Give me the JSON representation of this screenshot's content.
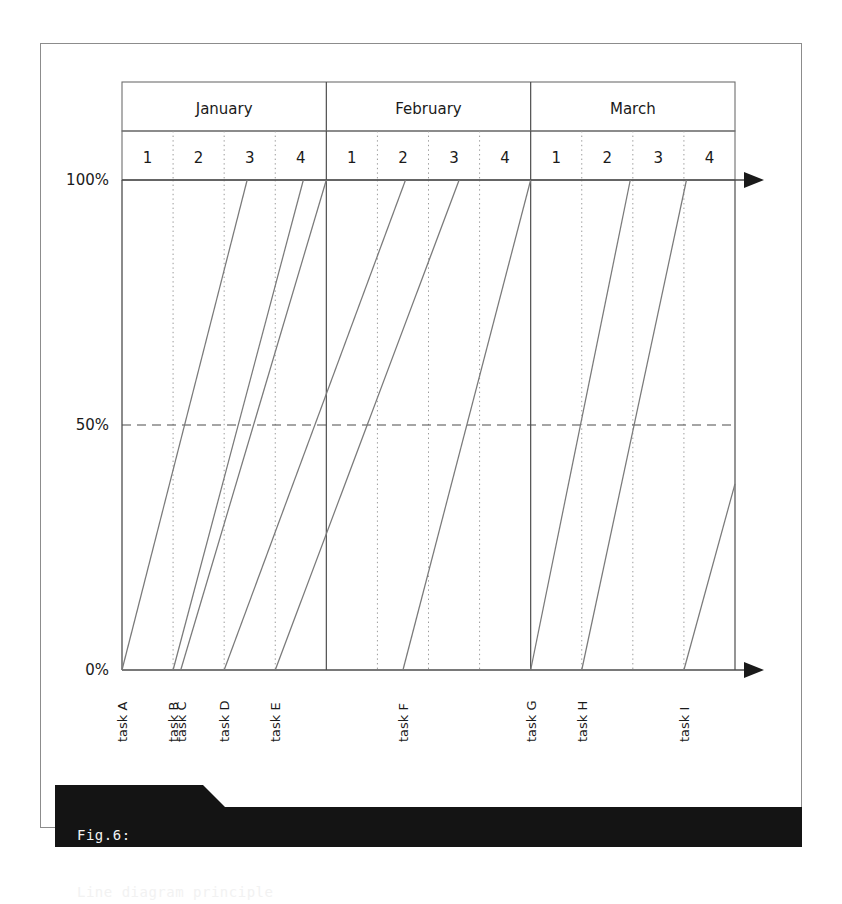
{
  "figure": {
    "caption_number": "Fig.6:",
    "caption_title": "Line diagram principle"
  },
  "chart_data": {
    "type": "line",
    "title": "Line diagram principle",
    "xlabel": "",
    "ylabel": "",
    "ylim": [
      0,
      100
    ],
    "ytick_labels": [
      "0%",
      "50%",
      "100%"
    ],
    "ytick_values": [
      0,
      50,
      100
    ],
    "grid": "dotted weekly gridlines, solid month separators, dashed 50% line",
    "legend": "none",
    "x_axis_type": "calendar weeks grouped by month",
    "months": [
      {
        "name": "January",
        "weeks": [
          "1",
          "2",
          "3",
          "4"
        ]
      },
      {
        "name": "February",
        "weeks": [
          "1",
          "2",
          "3",
          "4"
        ]
      },
      {
        "name": "March",
        "weeks": [
          "1",
          "2",
          "3",
          "4"
        ]
      }
    ],
    "x_total_weeks": 12,
    "series": [
      {
        "name": "task A",
        "start_week": 0.0,
        "end_week": 2.45,
        "start_pct": 0,
        "end_pct": 100,
        "truncated": false
      },
      {
        "name": "task B",
        "start_week": 1.0,
        "end_week": 3.55,
        "start_pct": 0,
        "end_pct": 100,
        "truncated": false
      },
      {
        "name": "task C",
        "start_week": 1.15,
        "end_week": 4.0,
        "start_pct": 0,
        "end_pct": 100,
        "truncated": false
      },
      {
        "name": "task D",
        "start_week": 2.0,
        "end_week": 5.55,
        "start_pct": 0,
        "end_pct": 100,
        "truncated": false
      },
      {
        "name": "task E",
        "start_week": 3.0,
        "end_week": 6.6,
        "start_pct": 0,
        "end_pct": 100,
        "truncated": false
      },
      {
        "name": "task F",
        "start_week": 5.5,
        "end_week": 8.0,
        "start_pct": 0,
        "end_pct": 100,
        "truncated": false
      },
      {
        "name": "task G",
        "start_week": 8.0,
        "end_week": 9.95,
        "start_pct": 0,
        "end_pct": 100,
        "truncated": false
      },
      {
        "name": "task H",
        "start_week": 9.0,
        "end_week": 11.05,
        "start_pct": 0,
        "end_pct": 100,
        "truncated": false
      },
      {
        "name": "task I",
        "start_week": 11.0,
        "end_week": 12.0,
        "start_pct": 0,
        "end_pct": 38,
        "truncated": true
      }
    ],
    "task_axis_labels": [
      "task A",
      "task B",
      "task C",
      "task D",
      "task E",
      "task F",
      "task G",
      "task H",
      "task I"
    ]
  },
  "colors": {
    "line": "#7a7a7a",
    "axis": "#4d4d4d",
    "grid_dotted": "#9a9a9a",
    "caption_bg": "#141414",
    "caption_text": "#f2f2f2",
    "frame": "#8c8c8c"
  }
}
